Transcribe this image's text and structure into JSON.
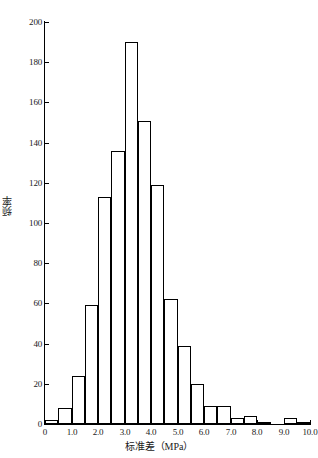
{
  "chart_data": {
    "type": "bar",
    "title": "",
    "subtitle": "",
    "xlabel": "标准差（MPa）",
    "ylabel": "频率",
    "xlim": [
      0,
      10
    ],
    "ylim": [
      0,
      200
    ],
    "grid": false,
    "legend": null,
    "bin_width": 0.5,
    "x_tick_labels": [
      "0",
      "1.0",
      "2.0",
      "3.0",
      "4.0",
      "5.0",
      "6.0",
      "7.0",
      "8.0",
      "9.0",
      "10.0"
    ],
    "x_tick_values": [
      0,
      1,
      2,
      3,
      4,
      5,
      6,
      7,
      8,
      9,
      10
    ],
    "y_tick_labels": [
      "0",
      "20",
      "40",
      "60",
      "80",
      "100",
      "120",
      "140",
      "160",
      "180",
      "200"
    ],
    "y_tick_values": [
      0,
      20,
      40,
      60,
      80,
      100,
      120,
      140,
      160,
      180,
      200
    ],
    "bin_edges": [
      0,
      0.5,
      1.0,
      1.5,
      2.0,
      2.5,
      3.0,
      3.5,
      4.0,
      4.5,
      5.0,
      5.5,
      6.0,
      6.5,
      7.0,
      7.5,
      8.0,
      8.5,
      9.0,
      9.5,
      10.0
    ],
    "categories": [
      "0-0.5",
      "0.5-1.0",
      "1.0-1.5",
      "1.5-2.0",
      "2.0-2.5",
      "2.5-3.0",
      "3.0-3.5",
      "3.5-4.0",
      "4.0-4.5",
      "4.5-5.0",
      "5.0-5.5",
      "5.5-6.0",
      "6.0-6.5",
      "6.5-7.0",
      "7.0-7.5",
      "7.5-8.0",
      "8.0-8.5",
      "8.5-9.0",
      "9.0-9.5",
      "9.5-10.0"
    ],
    "values": [
      2,
      8,
      24,
      59,
      113,
      136,
      190,
      151,
      119,
      62,
      39,
      20,
      9,
      9,
      3,
      4,
      1,
      0,
      3,
      1
    ],
    "bar_fill_color": "#ffffff",
    "bar_edge_color": "#000000",
    "axis_color": "#000000",
    "background_color": "#ffffff"
  }
}
